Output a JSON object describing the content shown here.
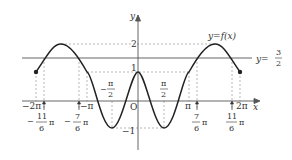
{
  "figure": {
    "curve_label": "y=f(x)",
    "line_label_prefix": "y=",
    "line_label_num": "3",
    "line_label_den": "2",
    "axis_x_label": "x",
    "axis_y_label": "y",
    "origin_label": "O",
    "y_ticks": {
      "two": "2",
      "one": "1",
      "neg_one": "−1"
    },
    "x_ticks": {
      "neg_two_pi": "−2π",
      "neg_pi": "−π",
      "pi": "π",
      "two_pi": "2π",
      "neg_half_pi_num": "π",
      "neg_half_pi_den": "2",
      "neg_half_pi_sign": "−",
      "half_pi_num": "π",
      "half_pi_den": "2",
      "neg_11_6_sign": "−",
      "neg_11_6_num": "11",
      "neg_11_6_den": "6",
      "neg_7_6_sign": "−",
      "neg_7_6_num": "7",
      "neg_7_6_den": "6",
      "pos_7_6_num": "7",
      "pos_7_6_den": "6",
      "pos_11_6_num": "11",
      "pos_11_6_den": "6",
      "pi_suffix": "π"
    },
    "colors": {
      "curve": "#333333",
      "line": "#666666",
      "dashed": "#999999"
    }
  }
}
